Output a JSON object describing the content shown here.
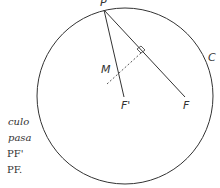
{
  "diagram": {
    "labels": {
      "P": "P",
      "M": "M",
      "F_prime": "F'",
      "F": "F",
      "C": "C"
    },
    "side_text": [
      "culo",
      "pasa",
      "PF'",
      "PF."
    ],
    "colors": {
      "stroke": "#333333",
      "background": "#ffffff"
    }
  }
}
